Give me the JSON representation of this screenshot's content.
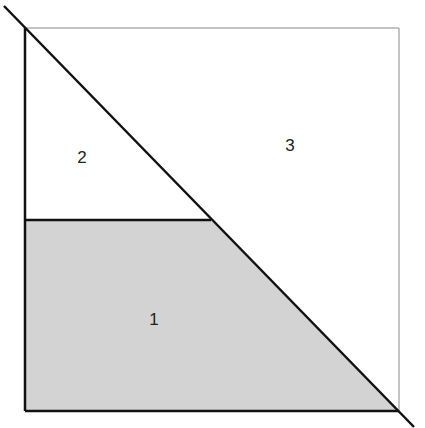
{
  "diagram": {
    "colors": {
      "shaded_fill": "#d3d3d3",
      "bold_stroke": "#111111",
      "thin_stroke": "#b0b0b0",
      "label": "#222222"
    },
    "regions": [
      {
        "id": "region-1",
        "label": "1",
        "shaded": true
      },
      {
        "id": "region-2",
        "label": "2",
        "shaded": false
      },
      {
        "id": "region-3",
        "label": "3",
        "shaded": false
      }
    ]
  }
}
